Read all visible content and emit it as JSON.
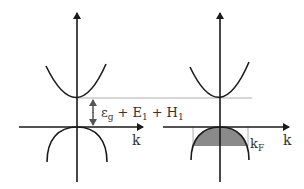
{
  "diagram": {
    "left_panel": {
      "axis_label_x": "k",
      "gap_label": {
        "epsilon": "ε",
        "epsilon_sub": "g",
        "plus1": "+",
        "E": "E",
        "E_sub": "1",
        "plus2": "+",
        "H": "H",
        "H_sub": "1"
      }
    },
    "right_panel": {
      "axis_label_x": "k",
      "fermi_label": "k",
      "fermi_sub": "F"
    },
    "colors": {
      "line": "#1a1a1a",
      "shade": "#8a8a8a",
      "guide": "#9a9a9a",
      "arrow": "#555555"
    }
  }
}
